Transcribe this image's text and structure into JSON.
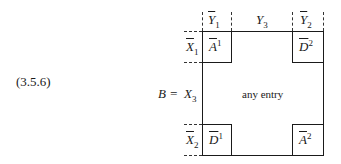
{
  "equation_number": "(3.5.6)",
  "lhs": "B =",
  "columns": {
    "y1": {
      "base": "Y",
      "sub": "1",
      "overline": true
    },
    "y3": {
      "base": "Y",
      "sub": "3",
      "overline": false
    },
    "y2": {
      "base": "Y",
      "sub": "2",
      "overline": true
    }
  },
  "rows": {
    "x1": {
      "base": "X",
      "sub": "1",
      "overline": true
    },
    "x3": {
      "base": "X",
      "sub": "3",
      "overline": false
    },
    "x2": {
      "base": "X",
      "sub": "2",
      "overline": true
    }
  },
  "blocks": {
    "top_left": {
      "base": "A",
      "sup": "1"
    },
    "top_right": {
      "base": "D",
      "sup": "2"
    },
    "bottom_left": {
      "base": "D",
      "sup": "1"
    },
    "bottom_right": {
      "base": "A",
      "sup": "2"
    }
  },
  "center_text": "any entry"
}
